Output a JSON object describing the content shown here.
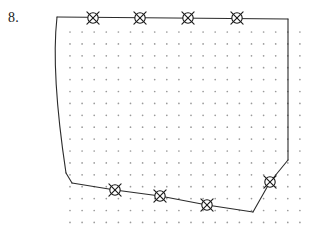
{
  "figure": {
    "problem_label": "8.",
    "caption": "",
    "canvas": {
      "width": 312,
      "height": 245
    },
    "colors": {
      "background": "#ffffff",
      "ink": "#2b2b2b",
      "grid_dot": "#9a9a9a",
      "marker_fill": "#ffffff",
      "marker_stroke": "#1a1a1a"
    },
    "dot_grid": {
      "origin_x": 70,
      "origin_y": 32,
      "spacing_x": 12.1,
      "spacing_y": 11.9,
      "cols": 20,
      "rows": 17,
      "dot_radius": 0.85
    },
    "boundary": {
      "description": "closed region with curved left edge, straight top edge, vertical right edge and zigzag bottom edge",
      "segments": [
        {
          "name": "top-edge",
          "type": "line",
          "points": [
            [
              57,
              17
            ],
            [
              288,
              19
            ]
          ]
        },
        {
          "name": "right-edge",
          "type": "line",
          "points": [
            [
              288,
              19
            ],
            [
              288,
              160
            ]
          ]
        },
        {
          "name": "right-lower-bevel",
          "type": "line",
          "points": [
            [
              288,
              160
            ],
            [
              270,
              182
            ]
          ]
        },
        {
          "name": "bottom-right-rise",
          "type": "line",
          "points": [
            [
              270,
              182
            ],
            [
              253,
              212
            ]
          ]
        },
        {
          "name": "bottom-edge-run",
          "type": "line",
          "points": [
            [
              253,
              212
            ],
            [
              207,
              205
            ],
            [
              160,
              196
            ],
            [
              115,
              190
            ]
          ]
        },
        {
          "name": "bottom-left-stub",
          "type": "line",
          "points": [
            [
              115,
              190
            ],
            [
              72,
              183
            ]
          ]
        },
        {
          "name": "left-corner-kick",
          "type": "line",
          "points": [
            [
              72,
              183
            ],
            [
              66,
              173
            ]
          ]
        },
        {
          "name": "left-curve",
          "type": "cubic-bezier",
          "points": [
            [
              66,
              173
            ],
            [
              58,
              120
            ],
            [
              52,
              62
            ],
            [
              57,
              17
            ]
          ]
        }
      ]
    },
    "markers": {
      "glyph": "crossed-circle",
      "radius": 5.2,
      "cross_overhang": 3.4,
      "items": [
        {
          "id": "m1",
          "x": 93,
          "y": 18,
          "edge": "top"
        },
        {
          "id": "m2",
          "x": 140,
          "y": 18,
          "edge": "top"
        },
        {
          "id": "m3",
          "x": 188,
          "y": 18,
          "edge": "top"
        },
        {
          "id": "m4",
          "x": 237,
          "y": 18,
          "edge": "top"
        },
        {
          "id": "m5",
          "x": 115,
          "y": 190,
          "edge": "bottom"
        },
        {
          "id": "m6",
          "x": 160,
          "y": 196,
          "edge": "bottom"
        },
        {
          "id": "m7",
          "x": 207,
          "y": 205,
          "edge": "bottom"
        },
        {
          "id": "m8",
          "x": 270,
          "y": 182,
          "edge": "bottom-right"
        }
      ]
    }
  }
}
